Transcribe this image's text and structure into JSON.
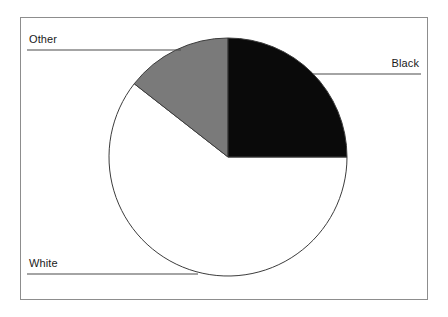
{
  "figure": {
    "width": 448,
    "height": 317,
    "background_color": "#ffffff",
    "frame_color": "#8d8d8d"
  },
  "chart_data": {
    "type": "pie",
    "title": "",
    "xlabel": "",
    "ylabel": "",
    "legend_position": "none",
    "grid": false,
    "start_angle_deg": 0,
    "direction": "clockwise",
    "categories": [
      "Black",
      "White",
      "Other"
    ],
    "values": [
      25.0,
      60.5,
      14.5
    ],
    "slices": [
      {
        "label": "Black",
        "value": 25.0,
        "color": "#0a0a0a",
        "start_angle_deg": 0,
        "end_angle_deg": 90,
        "label_side": "right"
      },
      {
        "label": "White",
        "value": 60.5,
        "color": "#ffffff",
        "start_angle_deg": 90,
        "end_angle_deg": 308,
        "label_side": "left"
      },
      {
        "label": "Other",
        "value": 14.5,
        "color": "#7a7a7a",
        "start_angle_deg": 308,
        "end_angle_deg": 360,
        "label_side": "left"
      }
    ],
    "geometry": {
      "center_x": 228,
      "center_y": 157,
      "radius": 119,
      "outline_color": "#3c3c3c"
    },
    "leader_lines": [
      {
        "label": "Other",
        "x1": 27,
        "y1": 50,
        "x2": 181,
        "y2": 50,
        "color": "#4a4a4a"
      },
      {
        "label": "Black",
        "x1": 313,
        "y1": 74,
        "x2": 421,
        "y2": 74,
        "color": "#4a4a4a"
      },
      {
        "label": "White",
        "x1": 27,
        "y1": 274,
        "x2": 198,
        "y2": 274,
        "color": "#4a4a4a"
      }
    ]
  },
  "labels": {
    "other": "Other",
    "black": "Black",
    "white": "White"
  }
}
